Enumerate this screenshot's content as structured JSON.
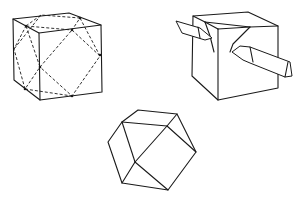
{
  "figure": {
    "panels": [
      {
        "id": "cube-with-cut-lines",
        "label": ""
      },
      {
        "id": "cube-being-cut-with-knives",
        "label": ""
      },
      {
        "id": "resulting-polyhedron",
        "label": ""
      }
    ],
    "colors": {
      "line": "#1a1a1a",
      "background": "#ffffff"
    }
  }
}
